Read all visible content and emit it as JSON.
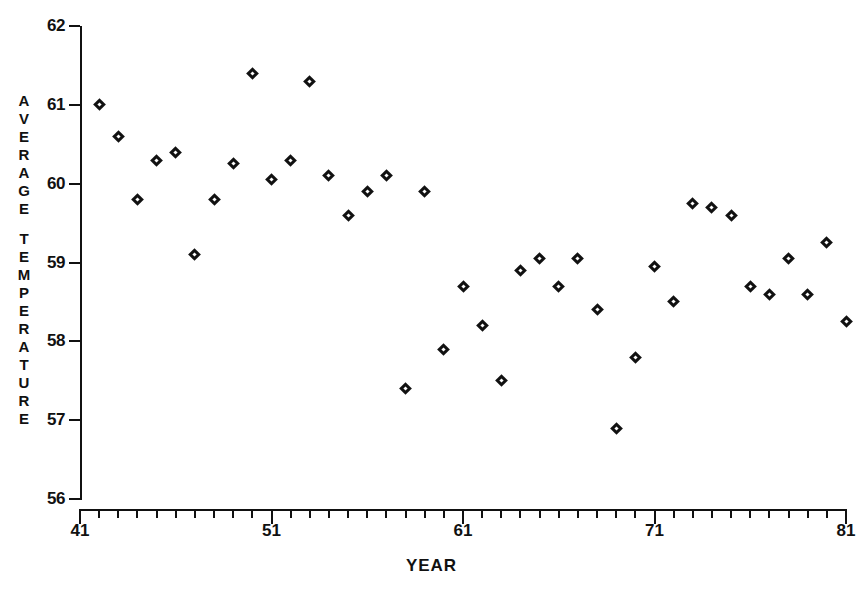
{
  "chart_data": {
    "type": "scatter",
    "title": "",
    "xlabel": "YEAR",
    "ylabel": "AVERAGE TEMPERATURE",
    "xlim": [
      41,
      81
    ],
    "ylim": [
      56,
      62
    ],
    "grid": false,
    "legend": null,
    "marker": "diamond-open",
    "x_major_ticks": [
      41,
      51,
      61,
      71,
      81
    ],
    "x_tick_labels": [
      "41",
      "51",
      "61",
      "71",
      "81"
    ],
    "x_minor_tick_step": 1,
    "y_ticks": [
      56,
      57,
      58,
      59,
      60,
      61,
      62
    ],
    "y_tick_labels": [
      "56",
      "57",
      "58",
      "59",
      "60",
      "61",
      "62"
    ],
    "x": [
      42,
      43,
      44,
      45,
      46,
      47,
      48,
      49,
      50,
      51,
      52,
      53,
      54,
      55,
      56,
      57,
      58,
      59,
      60,
      61,
      62,
      63,
      64,
      65,
      66,
      67,
      68,
      69,
      70,
      71,
      72,
      73,
      74,
      75,
      76,
      77,
      78,
      79,
      80,
      81
    ],
    "y": [
      61.0,
      60.6,
      59.8,
      60.3,
      60.4,
      59.1,
      59.8,
      60.25,
      61.4,
      60.05,
      60.3,
      61.3,
      60.1,
      59.6,
      59.9,
      60.1,
      57.4,
      59.9,
      57.9,
      58.7,
      58.2,
      57.5,
      58.9,
      59.05,
      58.7,
      59.05,
      58.4,
      56.9,
      57.8,
      58.95,
      58.5,
      59.75,
      59.7,
      59.6,
      58.7,
      58.6,
      59.05,
      58.6,
      59.25,
      58.25
    ],
    "points": [
      {
        "year": 42,
        "temp": 61.0
      },
      {
        "year": 43,
        "temp": 60.6
      },
      {
        "year": 44,
        "temp": 59.8
      },
      {
        "year": 45,
        "temp": 60.3
      },
      {
        "year": 46,
        "temp": 60.4
      },
      {
        "year": 47,
        "temp": 59.1
      },
      {
        "year": 48,
        "temp": 59.8
      },
      {
        "year": 49,
        "temp": 60.25
      },
      {
        "year": 50,
        "temp": 61.4
      },
      {
        "year": 51,
        "temp": 60.05
      },
      {
        "year": 52,
        "temp": 60.3
      },
      {
        "year": 53,
        "temp": 61.3
      },
      {
        "year": 54,
        "temp": 60.1
      },
      {
        "year": 55,
        "temp": 59.6
      },
      {
        "year": 56,
        "temp": 59.9
      },
      {
        "year": 57,
        "temp": 60.1
      },
      {
        "year": 58,
        "temp": 57.4
      },
      {
        "year": 59,
        "temp": 59.9
      },
      {
        "year": 60,
        "temp": 57.9
      },
      {
        "year": 61,
        "temp": 58.7
      },
      {
        "year": 62,
        "temp": 58.2
      },
      {
        "year": 63,
        "temp": 57.5
      },
      {
        "year": 64,
        "temp": 58.9
      },
      {
        "year": 65,
        "temp": 59.05
      },
      {
        "year": 66,
        "temp": 58.7
      },
      {
        "year": 67,
        "temp": 59.05
      },
      {
        "year": 68,
        "temp": 58.4
      },
      {
        "year": 69,
        "temp": 56.9
      },
      {
        "year": 70,
        "temp": 57.8
      },
      {
        "year": 71,
        "temp": 58.95
      },
      {
        "year": 72,
        "temp": 58.5
      },
      {
        "year": 73,
        "temp": 59.75
      },
      {
        "year": 74,
        "temp": 59.7
      },
      {
        "year": 75,
        "temp": 59.6
      },
      {
        "year": 76,
        "temp": 58.7
      },
      {
        "year": 77,
        "temp": 58.6
      },
      {
        "year": 78,
        "temp": 59.05
      },
      {
        "year": 79,
        "temp": 58.6
      },
      {
        "year": 80,
        "temp": 59.25
      },
      {
        "year": 81,
        "temp": 58.25
      }
    ]
  },
  "axes": {
    "y_title_letters": [
      "A",
      "V",
      "E",
      "R",
      "A",
      "G",
      "E",
      "",
      "T",
      "E",
      "M",
      "P",
      "E",
      "R",
      "A",
      "T",
      "U",
      "R",
      "E"
    ],
    "x_title": "YEAR"
  },
  "colors": {
    "ink": "#111111",
    "background": "#ffffff"
  }
}
